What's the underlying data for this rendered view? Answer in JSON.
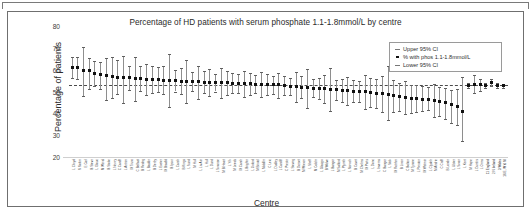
{
  "figure": {
    "title": "Percentage of HD patients with serum phosphate 1.1-1.8mmol/L by centre"
  },
  "legend": {
    "items": [
      {
        "label": "Upper 95% CI",
        "key": "dash-icon"
      },
      {
        "label": "% with phos 1.1-1.8mmol/L",
        "key": "dot-icon"
      },
      {
        "label": "Lower 95% CI",
        "key": "dash-icon"
      }
    ]
  },
  "chart_data": {
    "type": "scatter",
    "title": "Percentage of HD patients with serum phosphate 1.1-1.8mmol/L by centre",
    "xlabel": "Centre",
    "ylabel": "Percentage of patients",
    "ylim": [
      20,
      80
    ],
    "yticks": [
      20,
      30,
      40,
      50,
      60,
      70,
      80
    ],
    "grid": false,
    "legend_position": "top-right",
    "reference_line": {
      "value": 53.0,
      "style": "dashed",
      "label": ""
    },
    "series_names": [
      "% with phos 1.1-1.8mmol/L",
      "Upper 95% CI",
      "Lower 95% CI"
    ],
    "categories": [
      "L Clwyd",
      "N Nottm",
      "E Carl",
      "B Stevn",
      "L Glouc",
      "M Wirral",
      "B Stoke",
      "L Newry",
      "C Cardff",
      "L Antrim",
      "M Truro",
      "C Belfast",
      "B Redng",
      "L Basldn",
      "B Derby",
      "L Exeter",
      "M Bradfd",
      "B Ipswi",
      "L Carsh",
      "B Kings",
      "L Sund",
      "M Hull",
      "L Liv Ain",
      "L Hull",
      "L Dund",
      "L Swanse",
      "M B Heart",
      "L Yrk",
      "M Leeds",
      "M Camb",
      "L Brightn",
      "L Oxford",
      "M Bristol",
      "L Middlbr",
      "C Leic",
      "L Dudley",
      "L Cardiff",
      "C Prestn",
      "L Stevng",
      "B Dorset",
      "M Wrexm",
      "L Sheff",
      "M Colchr",
      "L Glasgw",
      "B Wolve",
      "L Bangor",
      "M Salford",
      "L Plymth",
      "L Norwch",
      "B Covnt",
      "M Chelms",
      "M Ports",
      "L Donc",
      "L Inverns",
      "C Bangor",
      "L Stok",
      "M Rotrhm",
      "B Lincn",
      "C Bolton",
      "M Tyrone",
      "L Preston",
      "M Wstmin",
      "L Clydeb",
      "M Airdrie",
      "C Crdff",
      "B Londn",
      "L Ulster",
      "L Swan",
      "L Kent",
      "M Hope",
      "L Dumfrs",
      "L Orms",
      "11 England",
      "2 N Ireland",
      "3 Wales",
      "16 E, W & NI"
    ],
    "values": [
      61.2,
      60.8,
      59.8,
      59.4,
      58.2,
      57.6,
      57.2,
      56.9,
      56.6,
      56.4,
      56.2,
      56.0,
      55.8,
      55.6,
      55.5,
      55.4,
      55.2,
      55.1,
      54.9,
      54.8,
      54.7,
      54.6,
      54.4,
      54.3,
      54.2,
      54.1,
      54.0,
      53.9,
      53.8,
      53.7,
      53.6,
      53.5,
      53.4,
      53.3,
      53.2,
      53.1,
      53.0,
      52.8,
      52.5,
      52.2,
      52.0,
      51.8,
      51.6,
      51.4,
      51.2,
      51.0,
      50.8,
      50.6,
      50.4,
      50.2,
      50.0,
      49.8,
      49.5,
      49.2,
      48.9,
      48.5,
      48.0,
      47.6,
      47.2,
      46.9,
      46.6,
      46.4,
      46.2,
      46.0,
      45.6,
      44.8,
      44.2,
      43.0,
      40.9,
      52.8,
      53.4,
      53.2,
      52.9,
      54.2,
      52.8,
      52.6
    ],
    "upper_ci": [
      65.8,
      65.9,
      70.2,
      65.3,
      63.8,
      63.4,
      65.2,
      65.8,
      64.2,
      66.2,
      61.7,
      66.0,
      61.7,
      62.4,
      61.6,
      61.4,
      61.6,
      67.3,
      59.9,
      60.8,
      64.2,
      58.9,
      61.8,
      59.3,
      60.4,
      58.2,
      60.8,
      59.3,
      58.4,
      57.9,
      59.6,
      58.6,
      57.4,
      58.8,
      57.8,
      57.2,
      58.7,
      57.0,
      56.4,
      58.9,
      57.0,
      60.2,
      55.8,
      56.2,
      57.6,
      60.6,
      55.4,
      55.9,
      56.8,
      55.2,
      54.9,
      57.4,
      56.0,
      55.6,
      57.2,
      61.8,
      55.1,
      53.9,
      54.7,
      53.2,
      52.9,
      52.6,
      52.2,
      53.4,
      52.2,
      51.8,
      50.9,
      51.2,
      56.7,
      54.0,
      57.4,
      55.8,
      53.9,
      55.6,
      53.8,
      53.4
    ],
    "lower_ci": [
      56.4,
      55.6,
      47.8,
      51.2,
      52.6,
      51.2,
      46.0,
      47.2,
      48.8,
      44.6,
      50.8,
      45.8,
      50.1,
      48.6,
      49.4,
      49.6,
      48.8,
      42.8,
      50.0,
      48.8,
      44.9,
      50.2,
      46.6,
      49.3,
      47.8,
      50.0,
      46.9,
      48.3,
      49.2,
      49.4,
      47.4,
      48.2,
      49.4,
      47.6,
      48.6,
      48.9,
      47.0,
      48.4,
      48.6,
      45.4,
      47.0,
      42.4,
      47.3,
      46.4,
      44.6,
      41.2,
      46.2,
      45.2,
      43.8,
      45.1,
      45.0,
      42.0,
      42.8,
      42.6,
      40.6,
      36.9,
      40.6,
      41.2,
      39.5,
      40.3,
      40.6,
      41.0,
      41.4,
      38.4,
      39.0,
      37.6,
      35.6,
      34.8,
      27.2,
      51.6,
      49.4,
      50.4,
      51.8,
      52.7,
      51.8,
      51.8
    ]
  },
  "axes": {
    "y_ticks": [
      "80",
      "70",
      "60",
      "50",
      "40",
      "30",
      "20"
    ],
    "y_title": "Percentage of patients",
    "x_title": "Centre"
  }
}
